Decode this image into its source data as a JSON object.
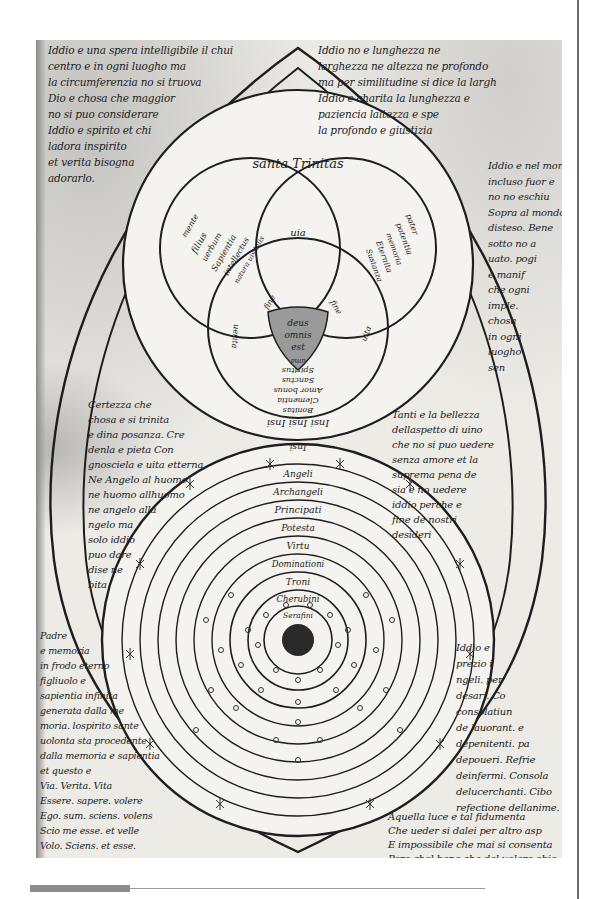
{
  "page": {
    "number": "28",
    "type": "manuscript-facsimile",
    "colors": {
      "ink": "#222222",
      "paper": "#ecebe6",
      "bar": "#8c8c8c",
      "rule": "#9a9a9a",
      "frame": "#6a6a6a"
    }
  },
  "upper_diagram": {
    "title": "santa Trinitas",
    "left_circle": [
      "mente",
      "filius",
      "uerbum",
      "Sapientia",
      "intellectus",
      "natura uisibilis"
    ],
    "right_circle": [
      "pater",
      "potentia",
      "memoria",
      "Eternita",
      "Sustanza"
    ],
    "top_lens": "uia",
    "center": [
      "deus",
      "omnis",
      "est"
    ],
    "left_lens": "fine",
    "right_lens": "fine",
    "bottom_point": "ama",
    "lower_left_label": "uerita",
    "lower_right_label": "uita",
    "lower_circle": [
      "Spiritus",
      "Sanctus",
      "Amor bonus",
      "Clementia",
      "Bonitas",
      "Insi Insi Insi"
    ],
    "below_label": "Insi"
  },
  "lower_diagram": {
    "rings": [
      "Angeli",
      "Archangeli",
      "Principati",
      "Potesta",
      "Virtu",
      "Dominationi",
      "Troni",
      "Cherubini",
      "Serafini"
    ]
  },
  "notes": {
    "top_left": "Iddio e una spera intelligibile il chui\ncentro e in ogni luogho ma\nla circumferenzia no si truova\nDio e chosa che maggior\nno si puo considerare\nIddio e spirito et chi\nladora inspirito\net verita bisogna\nadorarlo.",
    "top_right": "Iddio no e lunghezza ne\nlarghezza ne altezza ne profondo\nma per similitudine si dice la largh\nIddio e charita la lunghezza e\npaziencia laltezza e spe\nla profondo e giustizia",
    "right_upper": "Iddio e nel mondo\nincluso fuor e\nno no eschiu\nSopra al mondo\ndisteso. Bene\nsotto no a\nuato. pogi\ne manif\nche ogni\nimple.\nchosa\nin ogni\nluogho\nsen",
    "left_middle": "Certezza che\nchosa e si trinita\ne dina posanza. Cre\ndenla e pieta Con\ngnosciela e uita etterna\nNe Angelo al huomo\nne huomo allhuomo\nne angelo alla\nngelo ma\nsolo iddio\npuo dare\ndise ne\nbita",
    "right_middle": "Tanti e la bellezza\ndellaspetto di uino\nche no si puo uedere\nsenza amore et la\nsuprema pena de\nsia e no uedere\niddio perche e\nfine de nostri\ndesideri",
    "bottom_left": "Padre\ne memoria\nin frodo eterno\nfigliuolo e\nsapientia infinita\ngenerata dalla me\nmoria. lospirito sante\nuolonta sta procedente\ndalla memoria e sapientia\net questo e\nVia. Verita. Vita\nEssere. sapere. volere\nEgo. sum. sciens. volens\nScio me esse. et velle\nVolo. Sciens. et esse.",
    "right_lower": "Iddio e\nprezio i\nngeli. per\ndesari. Co\nconsolatiun\nde lauorant. e\ndepenitenti. pa\ndepoueri. Refrie\ndeinfermi. Consola\ndelucerchanti. Cibo\nrefectione dellanime.",
    "bottom_right": "Aquella luce e tal fidumenta\nChe ueder si dalei per altro asp\nE impossibile che mai si consenta\nPero chel bene che del uolere obie"
  },
  "footer": {
    "bar_label": "",
    "rule": true
  }
}
